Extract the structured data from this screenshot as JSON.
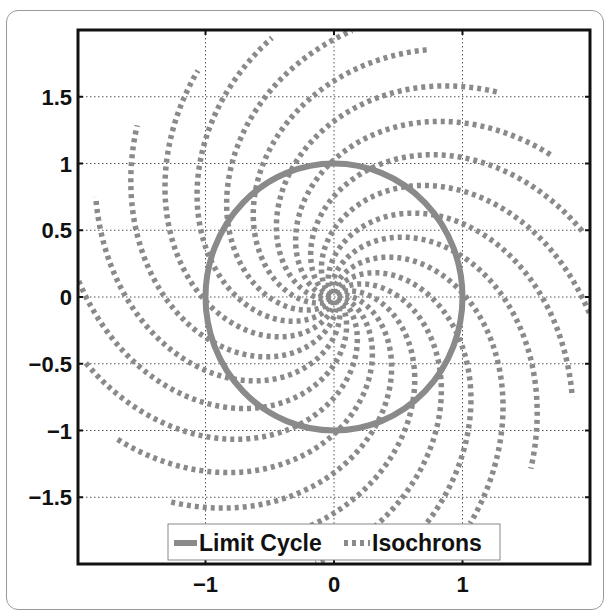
{
  "chart_data": {
    "type": "line",
    "title": "",
    "xlabel": "",
    "ylabel": "",
    "xlim": [
      -2,
      2
    ],
    "ylim": [
      -2,
      2
    ],
    "grid": true,
    "grid_style": "dotted",
    "x_ticks": [
      -1,
      0,
      1
    ],
    "x_tick_labels": [
      "−1",
      "0",
      "1"
    ],
    "y_ticks": [
      1.5,
      1,
      0.5,
      0,
      -0.5,
      -1,
      -1.5
    ],
    "y_tick_labels": [
      "1.5",
      "1",
      "0.5",
      "0",
      "−0.5",
      "−1",
      "−1.5"
    ],
    "legend_position": "bottom center (inside)",
    "series": [
      {
        "name": "Limit Cycle",
        "style": "solid",
        "color": "#8a8a8a",
        "shape": "circle",
        "center": [
          0,
          0
        ],
        "radius": 1
      },
      {
        "name": "Isochrons",
        "style": "dashed",
        "color": "#8a8a8a",
        "shape": "spiral",
        "count": 20,
        "r_range": [
          0.03,
          2.0
        ],
        "equation": "theta(r) = theta0 - (0.87*r + 0.25*ln r)",
        "a": 0.87,
        "b": 0.25,
        "theta0_first_deg": 249.6,
        "theta0_step_deg": 18,
        "endpoint_angles_deg_at_r2": [
          140,
          122,
          104,
          86,
          68,
          50,
          32,
          14,
          -4,
          -22,
          -40,
          -58,
          -76,
          -94,
          -112,
          -130,
          -148,
          -166,
          176,
          158
        ]
      }
    ]
  },
  "legend": {
    "items": [
      {
        "label": "Limit Cycle",
        "style": "solid"
      },
      {
        "label": "Isochrons",
        "style": "dashed"
      }
    ]
  },
  "colors": {
    "curve": "#8a8a8a",
    "axes": "#111111",
    "grid": "#555555"
  }
}
